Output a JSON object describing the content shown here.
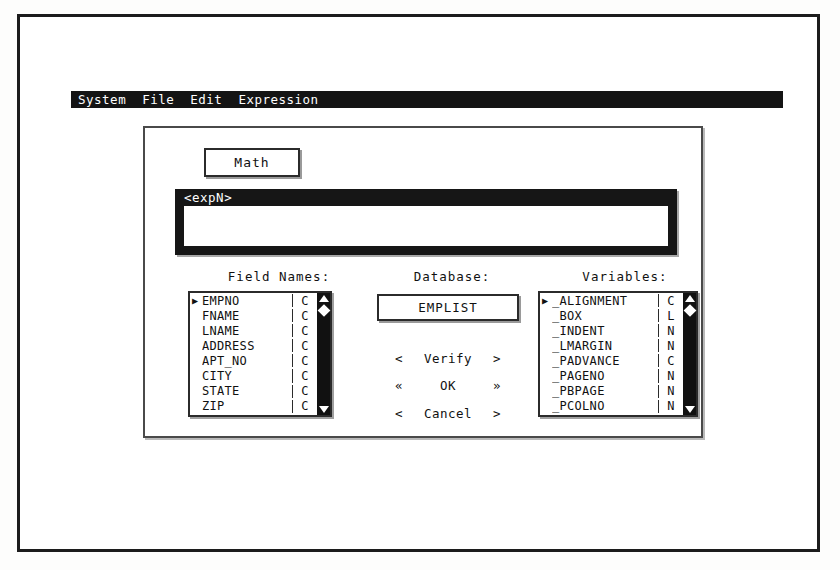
{
  "app": {
    "menubar": {
      "items": [
        {
          "label": "System",
          "name": "menu-system"
        },
        {
          "label": "File",
          "name": "menu-file"
        },
        {
          "label": "Edit",
          "name": "menu-edit"
        },
        {
          "label": "Expression",
          "name": "menu-expression"
        }
      ]
    }
  },
  "dialog": {
    "math_button_label": "Math",
    "expression": {
      "label": "<expN>",
      "value": "",
      "placeholder": ""
    },
    "headings": {
      "fields": "Field Names:",
      "database": "Database:",
      "variables": "Variables:"
    },
    "field_names": {
      "columns": [
        "Name",
        "Type"
      ],
      "selected_index": 0,
      "rows": [
        {
          "marker": "▶",
          "name": "EMPNO",
          "type": "C"
        },
        {
          "marker": " ",
          "name": "FNAME",
          "type": "C"
        },
        {
          "marker": " ",
          "name": "LNAME",
          "type": "C"
        },
        {
          "marker": " ",
          "name": "ADDRESS",
          "type": "C"
        },
        {
          "marker": " ",
          "name": "APT_NO",
          "type": "C"
        },
        {
          "marker": " ",
          "name": "CITY",
          "type": "C"
        },
        {
          "marker": " ",
          "name": "STATE",
          "type": "C"
        },
        {
          "marker": " ",
          "name": "ZIP",
          "type": "C"
        }
      ]
    },
    "variables": {
      "columns": [
        "Name",
        "Type"
      ],
      "selected_index": 0,
      "rows": [
        {
          "marker": "▶",
          "name": "_ALIGNMENT",
          "type": "C"
        },
        {
          "marker": " ",
          "name": "_BOX",
          "type": "L"
        },
        {
          "marker": " ",
          "name": "_INDENT",
          "type": "N"
        },
        {
          "marker": " ",
          "name": "_LMARGIN",
          "type": "N"
        },
        {
          "marker": " ",
          "name": "_PADVANCE",
          "type": "C"
        },
        {
          "marker": " ",
          "name": "_PAGENO",
          "type": "N"
        },
        {
          "marker": " ",
          "name": "_PBPAGE",
          "type": "N"
        },
        {
          "marker": " ",
          "name": "_PCOLNO",
          "type": "N"
        }
      ]
    },
    "database_button_label": "EMPLIST",
    "buttons": [
      {
        "left": "<",
        "label": "Verify",
        "right": ">",
        "name": "verify-button"
      },
      {
        "left": "«",
        "label": "OK",
        "right": "»",
        "name": "ok-button"
      },
      {
        "left": "<",
        "label": "Cancel",
        "right": ">",
        "name": "cancel-button"
      }
    ]
  },
  "scrollbar": {
    "up_icon": "triangle-up-icon",
    "down_icon": "triangle-down-icon",
    "thumb_icon": "diamond-thumb-icon"
  },
  "colors": {
    "screen_bg": "#ffffff",
    "menubar_bg": "#141414",
    "menubar_fg": "#ffffff",
    "expr_band_bg": "#161616",
    "border": "#2b2b2b",
    "text": "#111111"
  }
}
